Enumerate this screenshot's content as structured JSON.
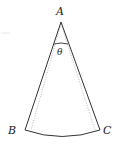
{
  "diagram": {
    "type": "sector",
    "labels": {
      "apex": "A",
      "left": "B",
      "right": "C",
      "angle": "θ"
    },
    "colors": {
      "stroke": "#333333",
      "dotted": "#999999"
    }
  }
}
